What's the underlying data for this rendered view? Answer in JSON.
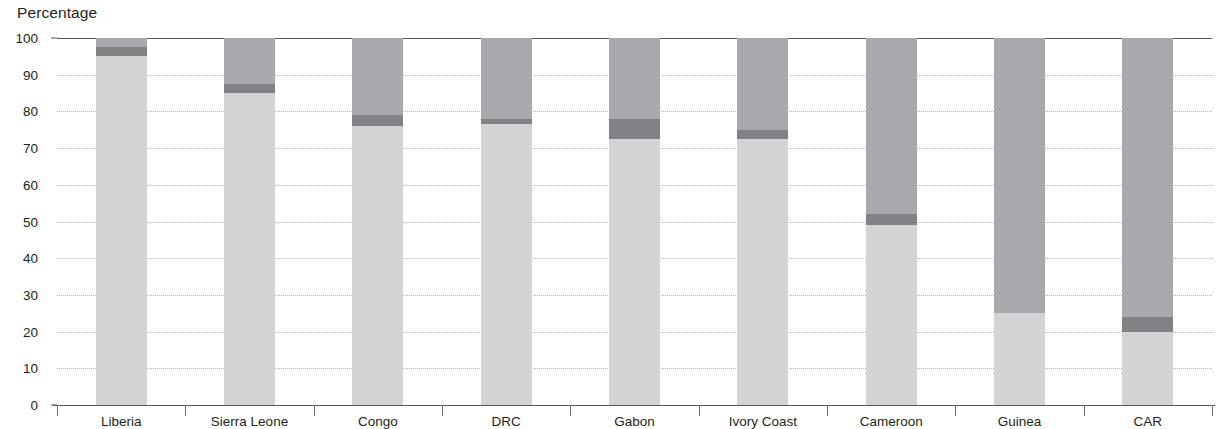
{
  "chart_data": {
    "type": "bar",
    "subtype": "stacked-bar",
    "title": "Percentage",
    "xlabel": "",
    "ylabel": "Percentage",
    "ylim": [
      0,
      100
    ],
    "yticks": [
      0,
      10,
      20,
      30,
      40,
      50,
      60,
      70,
      80,
      90,
      100
    ],
    "ytick_labels": [
      "0",
      "10",
      "20",
      "30",
      "40",
      "50",
      "60",
      "70",
      "80",
      "90",
      "100"
    ],
    "grid": "horizontal-dotted",
    "legend": "none",
    "categories": [
      "Liberia",
      "Sierra Leone",
      "Congo",
      "DRC",
      "Gabon",
      "Ivory Coast",
      "Cameroon",
      "Guinea",
      "CAR"
    ],
    "series": [
      {
        "name": "Light",
        "color": "#d2d3d4",
        "values": [
          95,
          85,
          76,
          76.5,
          72.5,
          72.5,
          49,
          25,
          20
        ]
      },
      {
        "name": "Dark",
        "color": "#808285",
        "values": [
          2.5,
          2.5,
          3,
          1.5,
          5.5,
          2.5,
          3,
          0,
          4
        ]
      },
      {
        "name": "Medium",
        "color": "#a7a9ac",
        "values": [
          2.5,
          12.5,
          21,
          22,
          22,
          25,
          48,
          75,
          76
        ]
      }
    ],
    "cumulative_tops": {
      "Liberia": [
        95,
        97.5,
        100
      ],
      "Sierra Leone": [
        85,
        87.5,
        100
      ],
      "Congo": [
        76,
        79,
        100
      ],
      "DRC": [
        76.5,
        78,
        100
      ],
      "Gabon": [
        72.5,
        78,
        100
      ],
      "Ivory Coast": [
        72.5,
        75,
        100
      ],
      "Cameroon": [
        49,
        52,
        100
      ],
      "Guinea": [
        25,
        25,
        100
      ],
      "CAR": [
        20,
        24,
        100
      ]
    },
    "colors": {
      "light": "#d2d3d4",
      "medium": "#a7a9ac",
      "dark": "#808285",
      "axis": "#58595b",
      "grid": "#b9bcbe",
      "text": "#231f20"
    }
  }
}
